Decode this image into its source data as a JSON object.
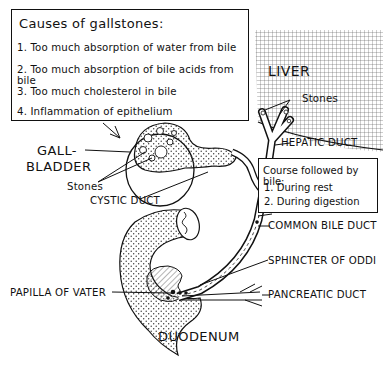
{
  "diagram": {
    "type": "anatomical illustration",
    "causes_box": {
      "title": "Causes of gallstones:",
      "items": [
        "1. Too much absorption of water from bile",
        "2. Too much absorption of bile acids from bile",
        "3. Too much cholesterol in bile",
        "4. Inflammation of epithelium"
      ]
    },
    "course_box": {
      "title": "Course followed by bile:",
      "items": [
        "1. During rest",
        "2. During digestion"
      ]
    },
    "labels": {
      "liver": "LIVER",
      "stones_liver": "Stones",
      "hepatic_duct": "HEPATIC DUCT",
      "gallbladder_line1": "GALL-",
      "gallbladder_line2": "BLADDER",
      "stones_gallbladder": "Stones",
      "cystic_duct": "CYSTIC DUCT",
      "common_bile_duct": "COMMON BILE DUCT",
      "sphincter_of_oddi": "SPHINCTER OF ODDI",
      "papilla_of_vater": "PAPILLA OF VATER",
      "pancreatic_duct": "PANCREATIC DUCT",
      "duodenum": "DUODENUM"
    },
    "colors": {
      "ink": "#111111",
      "background": "#ffffff",
      "liver_grid": "#555555",
      "stipple": "#333333"
    }
  }
}
